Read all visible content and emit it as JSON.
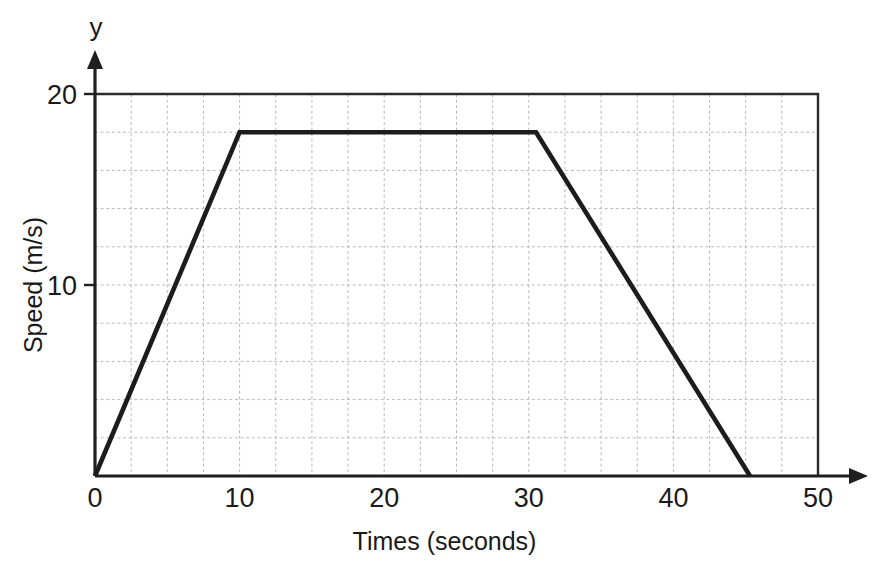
{
  "chart_data": {
    "type": "line",
    "title": "",
    "xlabel": "Times (seconds)",
    "ylabel": "Speed (m/s)",
    "x_axis_name": "x",
    "y_axis_name": "y",
    "xlim": [
      0,
      50
    ],
    "ylim": [
      0,
      20
    ],
    "x_ticks": [
      0,
      10,
      20,
      30,
      40,
      50
    ],
    "x_tick_labels": [
      "0",
      "10",
      "20",
      "30",
      "40",
      "50"
    ],
    "y_ticks": [
      10,
      20
    ],
    "y_tick_labels": [
      "10",
      "20"
    ],
    "x_minor_step": 2.5,
    "y_minor_step": 2,
    "grid": true,
    "grid_style": "dashed",
    "legend": "none",
    "series": [
      {
        "name": "speed-time",
        "x": [
          0,
          10,
          30.5,
          45.3
        ],
        "y": [
          0,
          18,
          18,
          0
        ]
      }
    ],
    "annotations": {
      "plateau_speed": 18,
      "acceleration_end_time": 10,
      "deceleration_start_time": 30.5,
      "stop_time": 45.3
    },
    "colors": {
      "series": "#1c1c1c",
      "grid": "#b9b9bd",
      "axis": "#1f1f1f",
      "frame": "#2b2b2b",
      "background": "#ffffff"
    }
  },
  "ticks": {
    "x": [
      {
        "label": "0",
        "value": 0
      },
      {
        "label": "10",
        "value": 10
      },
      {
        "label": "20",
        "value": 20
      },
      {
        "label": "30",
        "value": 30
      },
      {
        "label": "40",
        "value": 40
      },
      {
        "label": "50",
        "value": 50
      }
    ],
    "y": [
      {
        "label": "10",
        "value": 10
      },
      {
        "label": "20",
        "value": 20
      }
    ]
  },
  "labels": {
    "x_axis_title": "Times (seconds)",
    "y_axis_title": "Speed (m/s)",
    "x_axis_name": "x",
    "y_axis_name": "y"
  }
}
